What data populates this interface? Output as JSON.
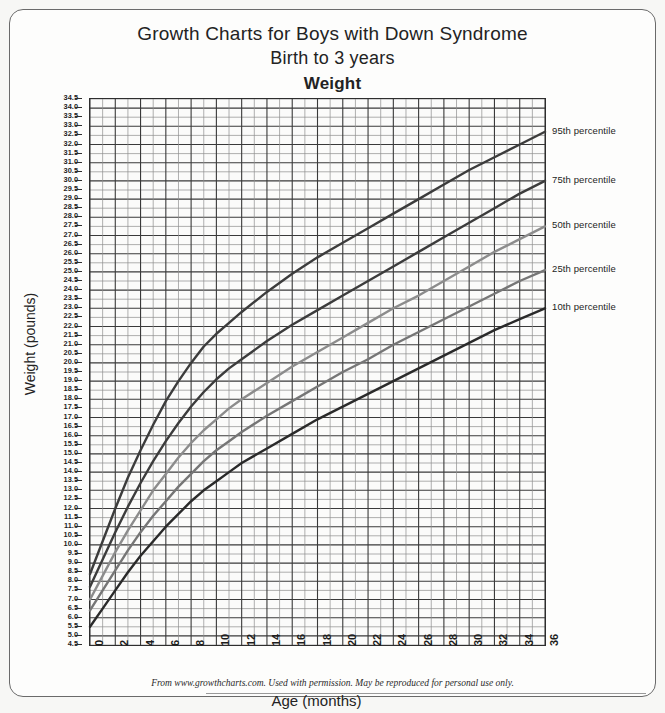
{
  "document": {
    "title_line1": "Growth Charts for Boys with Down Syndrome",
    "title_line2": "Birth to 3 years",
    "title_line3": "Weight",
    "footer": "From www.growthcharts.com. Used with permission. May be reproduced for personal use only."
  },
  "chart_data": {
    "type": "line",
    "xlabel": "Age (months)",
    "ylabel": "Weight (pounds)",
    "xlim": [
      0,
      36
    ],
    "ylim": [
      4.5,
      34.5
    ],
    "ytick_step": 0.5,
    "xtick_step": 2,
    "grid": true,
    "legend_position": "right-inline-labels",
    "xticks": [
      0,
      2,
      4,
      6,
      8,
      10,
      12,
      14,
      16,
      18,
      20,
      22,
      24,
      26,
      28,
      30,
      32,
      34,
      36
    ],
    "yticks": [
      34.5,
      34.0,
      33.5,
      33.0,
      32.5,
      32.0,
      31.5,
      31.0,
      30.5,
      30.0,
      29.5,
      29.0,
      28.5,
      28.0,
      27.5,
      27.0,
      26.5,
      26.0,
      25.5,
      25.0,
      24.5,
      24.0,
      23.5,
      23.0,
      22.5,
      22.0,
      21.5,
      21.0,
      20.5,
      20.0,
      19.5,
      19.0,
      18.5,
      18.0,
      17.5,
      17.0,
      16.5,
      16.0,
      15.5,
      15.0,
      14.5,
      14.0,
      13.5,
      13.0,
      12.5,
      12.0,
      11.5,
      11.0,
      10.5,
      10.0,
      9.5,
      9.0,
      8.5,
      8.0,
      7.5,
      7.0,
      6.5,
      6.0,
      5.5,
      5.0,
      4.5
    ],
    "x": [
      0,
      1,
      2,
      3,
      4,
      5,
      6,
      7,
      8,
      9,
      10,
      11,
      12,
      14,
      16,
      18,
      20,
      22,
      24,
      26,
      28,
      30,
      32,
      34,
      36
    ],
    "series": [
      {
        "name": "95th percentile",
        "color": "#3c3c3c",
        "values": [
          8.4,
          10.2,
          12.0,
          13.7,
          15.2,
          16.6,
          17.9,
          19.0,
          20.0,
          20.9,
          21.6,
          22.2,
          22.8,
          23.9,
          24.9,
          25.8,
          26.6,
          27.4,
          28.2,
          29.0,
          29.8,
          30.6,
          31.3,
          32.0,
          32.7
        ]
      },
      {
        "name": "75th percentile",
        "color": "#3c3c3c",
        "values": [
          7.7,
          9.2,
          10.7,
          12.1,
          13.4,
          14.6,
          15.7,
          16.7,
          17.6,
          18.4,
          19.1,
          19.7,
          20.2,
          21.2,
          22.1,
          22.9,
          23.7,
          24.5,
          25.3,
          26.1,
          26.9,
          27.7,
          28.5,
          29.3,
          30.0
        ]
      },
      {
        "name": "50th percentile",
        "color": "#8c8c8c",
        "values": [
          7.0,
          8.3,
          9.6,
          10.8,
          11.9,
          13.0,
          13.9,
          14.8,
          15.6,
          16.3,
          16.9,
          17.5,
          18.0,
          18.9,
          19.8,
          20.6,
          21.4,
          22.2,
          23.0,
          23.7,
          24.5,
          25.3,
          26.1,
          26.8,
          27.5
        ]
      },
      {
        "name": "25th percentile",
        "color": "#767676",
        "values": [
          6.4,
          7.5,
          8.6,
          9.7,
          10.7,
          11.6,
          12.4,
          13.2,
          13.9,
          14.6,
          15.2,
          15.7,
          16.2,
          17.1,
          17.9,
          18.7,
          19.5,
          20.2,
          21.0,
          21.7,
          22.4,
          23.1,
          23.8,
          24.5,
          25.1
        ]
      },
      {
        "name": "10th percentile",
        "color": "#2a2a2a",
        "values": [
          5.5,
          6.5,
          7.5,
          8.5,
          9.4,
          10.2,
          11.0,
          11.7,
          12.4,
          13.0,
          13.5,
          14.0,
          14.5,
          15.3,
          16.1,
          16.9,
          17.6,
          18.3,
          19.0,
          19.7,
          20.4,
          21.1,
          21.8,
          22.4,
          23.0
        ]
      }
    ],
    "annotations": [
      {
        "label": "95th percentile",
        "at_x": 36,
        "at_y": 32.7
      },
      {
        "label": "75th percentile",
        "at_x": 36,
        "at_y": 30.0
      },
      {
        "label": "50th percentile",
        "at_x": 36,
        "at_y": 27.5
      },
      {
        "label": "25th percentile",
        "at_x": 36,
        "at_y": 25.1
      },
      {
        "label": "10th percentile",
        "at_x": 36,
        "at_y": 23.0
      }
    ]
  }
}
